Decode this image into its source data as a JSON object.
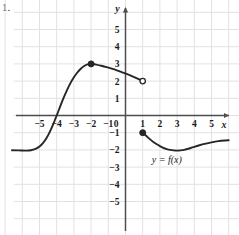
{
  "item_number": "1.",
  "chart_data": {
    "type": "line",
    "title": "",
    "xlabel": "x",
    "ylabel": "y",
    "xlim": [
      -6.6,
      6.0
    ],
    "ylim": [
      -6.2,
      5.8
    ],
    "grid": true,
    "legend": "none",
    "annotations": [
      {
        "name": "function-label",
        "text": "y = f(x)",
        "x": 2.4,
        "y": -2.75
      }
    ],
    "x_ticks": [
      -5,
      -4,
      -3,
      -2,
      -1,
      0,
      1,
      2,
      3,
      4,
      5
    ],
    "x_tick_labels": [
      "−5",
      "−4",
      "−3",
      "−2",
      "−1",
      "0",
      "1",
      "2",
      "3",
      "4",
      "5"
    ],
    "y_ticks": [
      -5,
      -4,
      -3,
      -2,
      -1,
      1,
      2,
      3,
      4,
      5
    ],
    "y_tick_labels": [
      "−5",
      "−4",
      "−3",
      "−2",
      "−1",
      "1",
      "2",
      "3",
      "4",
      "5"
    ],
    "series": [
      {
        "name": "left-branch",
        "points": [
          [
            -6.6,
            -2.02
          ],
          [
            -6.2,
            -2.03
          ],
          [
            -5.8,
            -2.04
          ],
          [
            -5.5,
            -2.02
          ],
          [
            -5.2,
            -1.92
          ],
          [
            -5.0,
            -1.8
          ],
          [
            -4.8,
            -1.6
          ],
          [
            -4.6,
            -1.32
          ],
          [
            -4.4,
            -0.95
          ],
          [
            -4.2,
            -0.5
          ],
          [
            -4.0,
            0.0
          ],
          [
            -3.8,
            0.52
          ],
          [
            -3.6,
            1.02
          ],
          [
            -3.4,
            1.48
          ],
          [
            -3.2,
            1.88
          ],
          [
            -3.0,
            2.22
          ],
          [
            -2.8,
            2.5
          ],
          [
            -2.6,
            2.72
          ],
          [
            -2.4,
            2.88
          ],
          [
            -2.2,
            2.97
          ],
          [
            -2.0,
            3.0
          ]
        ],
        "endpoint_start": "none",
        "endpoint_end": "closed"
      },
      {
        "name": "middle-branch",
        "points": [
          [
            -2.0,
            3.0
          ],
          [
            -1.7,
            2.96
          ],
          [
            -1.4,
            2.89
          ],
          [
            -1.1,
            2.81
          ],
          [
            -0.8,
            2.72
          ],
          [
            -0.5,
            2.62
          ],
          [
            -0.2,
            2.51
          ],
          [
            0.1,
            2.4
          ],
          [
            0.4,
            2.28
          ],
          [
            0.7,
            2.15
          ],
          [
            1.0,
            2.0
          ]
        ],
        "endpoint_start": "closed",
        "endpoint_end": "open"
      },
      {
        "name": "right-branch",
        "points": [
          [
            1.0,
            -1.0
          ],
          [
            1.2,
            -1.18
          ],
          [
            1.4,
            -1.36
          ],
          [
            1.6,
            -1.52
          ],
          [
            1.8,
            -1.66
          ],
          [
            2.0,
            -1.78
          ],
          [
            2.2,
            -1.88
          ],
          [
            2.4,
            -1.95
          ],
          [
            2.6,
            -2.0
          ],
          [
            2.8,
            -2.03
          ],
          [
            3.0,
            -2.04
          ],
          [
            3.2,
            -2.03
          ],
          [
            3.4,
            -2.0
          ],
          [
            3.6,
            -1.95
          ],
          [
            3.8,
            -1.89
          ],
          [
            4.0,
            -1.82
          ],
          [
            4.3,
            -1.73
          ],
          [
            4.6,
            -1.65
          ],
          [
            5.0,
            -1.56
          ],
          [
            5.4,
            -1.49
          ],
          [
            5.8,
            -1.45
          ],
          [
            6.0,
            -1.44
          ]
        ],
        "endpoint_start": "closed",
        "endpoint_end": "none"
      }
    ],
    "markers": [
      {
        "name": "local-max-point",
        "x": -2,
        "y": 3,
        "style": "closed"
      },
      {
        "name": "open-endpoint",
        "x": 1,
        "y": 2,
        "style": "open"
      },
      {
        "name": "closed-endpoint",
        "x": 1,
        "y": -1,
        "style": "closed"
      }
    ]
  },
  "colors": {
    "curve": "#262626",
    "axis": "#4d4d4d",
    "grid": "#e2e2e6",
    "text": "#1a1a1a",
    "background": "#ffffff"
  }
}
